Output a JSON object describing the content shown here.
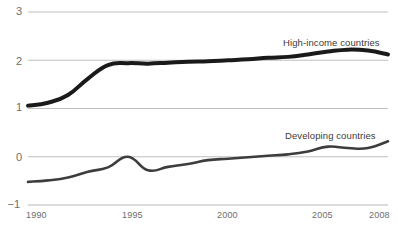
{
  "chart_data": {
    "type": "line",
    "title": "",
    "subtitle": "",
    "xlabel": "",
    "ylabel": "",
    "xlim": [
      1990,
      2008
    ],
    "ylim": [
      -1,
      3
    ],
    "grid": true,
    "legend_position": "inline-right",
    "x_ticks": [
      "1990",
      "1995",
      "2000",
      "2005",
      "2008"
    ],
    "x_tick_values": [
      1990,
      1995,
      2000,
      2005,
      2008
    ],
    "y_ticks": [
      "3",
      "2",
      "1",
      "0",
      "−1"
    ],
    "y_tick_values": [
      3,
      2,
      1,
      0,
      -1
    ],
    "x": [
      1990,
      1991,
      1992,
      1993,
      1994,
      1995,
      1996,
      1997,
      1998,
      1999,
      2000,
      2001,
      2002,
      2003,
      2004,
      2005,
      2006,
      2007,
      2008
    ],
    "series": [
      {
        "name": "High-income countries",
        "color": "#1a1a1a",
        "line_width": 4,
        "label_x": 283,
        "label_y": 37,
        "values": [
          1.06,
          1.12,
          1.28,
          1.62,
          1.9,
          1.94,
          1.93,
          1.95,
          1.97,
          1.98,
          2.0,
          2.02,
          2.05,
          2.07,
          2.12,
          2.18,
          2.22,
          2.2,
          2.12
        ]
      },
      {
        "name": "Developing countries",
        "color": "#3d3d3d",
        "line_width": 2.6,
        "label_x": 285,
        "label_y": 130,
        "values": [
          -0.52,
          -0.49,
          -0.43,
          -0.31,
          -0.22,
          0.0,
          -0.28,
          -0.21,
          -0.15,
          -0.07,
          -0.04,
          -0.01,
          0.02,
          0.05,
          0.11,
          0.21,
          0.18,
          0.18,
          0.32
        ]
      }
    ],
    "axis_color": "#b8b8b8",
    "tick_label_color": "#6d6d6d",
    "background": "#ffffff",
    "plot_area": {
      "left": 28,
      "right": 388,
      "top": 12,
      "bottom": 205
    }
  }
}
